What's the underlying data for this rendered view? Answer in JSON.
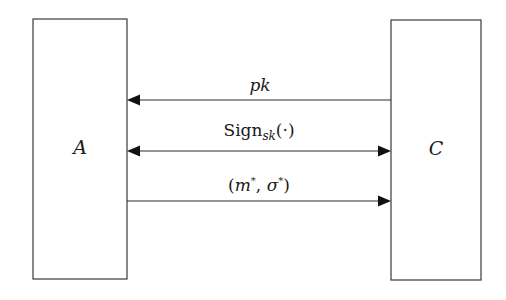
{
  "diagram": {
    "type": "security-game-protocol",
    "entities": [
      {
        "id": "A",
        "label": "A"
      },
      {
        "id": "C",
        "label": "C"
      }
    ],
    "messages": [
      {
        "id": "pk",
        "label": "pk",
        "from": "C",
        "to": "A",
        "direction": "C-to-A"
      },
      {
        "id": "sign-oracle",
        "label_main": "Sign",
        "label_sub": "sk",
        "label_arg": "(·)",
        "from": "A",
        "to": "C",
        "direction": "bidirectional"
      },
      {
        "id": "forgery",
        "label_open": "(",
        "label_m": "m",
        "label_star1": "*",
        "label_sep": ", ",
        "label_sigma": "σ",
        "label_star2": "*",
        "label_close": ")",
        "from": "A",
        "to": "C",
        "direction": "A-to-C"
      }
    ]
  },
  "colors": {
    "stroke": "#2a2a2a",
    "text": "#1a1a1a",
    "background": "#ffffff"
  }
}
